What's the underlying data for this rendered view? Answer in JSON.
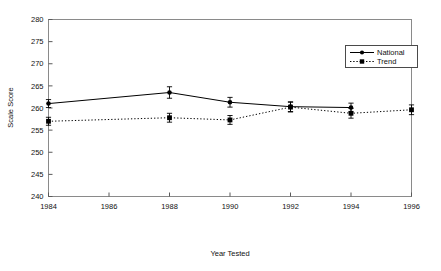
{
  "chart_data": {
    "type": "line",
    "title": "",
    "xlabel": "Year Tested",
    "ylabel": "Scale Score",
    "xlim": [
      1984,
      1996
    ],
    "ylim": [
      240,
      280
    ],
    "xticks": [
      1984,
      1986,
      1988,
      1990,
      1992,
      1994,
      1996
    ],
    "yticks": [
      240,
      245,
      250,
      255,
      260,
      265,
      270,
      275,
      280
    ],
    "grid": false,
    "legend_position": "top-right",
    "series": [
      {
        "name": "National",
        "line_style": "solid",
        "marker": "circle",
        "color": "#000000",
        "x": [
          1984,
          1988,
          1990,
          1992,
          1994
        ],
        "values": [
          261.0,
          263.5,
          261.3,
          260.3,
          260.1
        ],
        "errors": [
          0.9,
          1.3,
          1.1,
          1.1,
          1.0
        ]
      },
      {
        "name": "Trend",
        "line_style": "dotted",
        "marker": "square",
        "color": "#000000",
        "x": [
          1984,
          1988,
          1990,
          1992,
          1994,
          1996
        ],
        "values": [
          257.0,
          257.8,
          257.3,
          260.2,
          258.8,
          259.6
        ],
        "errors": [
          0.9,
          1.0,
          1.0,
          1.1,
          1.1,
          1.1
        ]
      }
    ]
  },
  "axes": {
    "ylabel": "Scale Score",
    "xlabel": "Year Tested",
    "ytick_labels": [
      "280",
      "275",
      "270",
      "265",
      "260",
      "255",
      "250",
      "245",
      "240"
    ],
    "xtick_labels": [
      "1984",
      "1986",
      "1988",
      "1990",
      "1992",
      "1994",
      "1996"
    ]
  },
  "legend": {
    "entries": [
      {
        "label": "National"
      },
      {
        "label": "Trend"
      }
    ]
  }
}
